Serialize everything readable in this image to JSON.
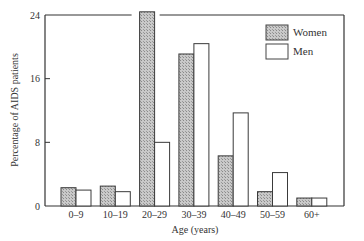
{
  "chart_data": {
    "type": "bar",
    "title": "",
    "xlabel": "Age (years)",
    "ylabel": "Percentage of AIDS patients",
    "ylim": [
      0,
      24
    ],
    "yticks": [
      0,
      8,
      16,
      24
    ],
    "grid": false,
    "legend_position": "upper right",
    "categories": [
      "0–9",
      "10–19",
      "20–29",
      "30–39",
      "40–49",
      "50–59",
      "60+"
    ],
    "series": [
      {
        "name": "Women",
        "pattern": "hatched-gray",
        "color": "#b8b8b8",
        "values": [
          2.3,
          2.5,
          24.4,
          19.1,
          6.3,
          1.8,
          1.0
        ]
      },
      {
        "name": "Men",
        "pattern": "white",
        "color": "#ffffff",
        "values": [
          2.0,
          1.8,
          8.0,
          20.4,
          11.7,
          4.2,
          1.0
        ]
      }
    ],
    "annotations": [
      "Women 20–29 bar breaks through top frame (exceeds 24)"
    ]
  },
  "legend": {
    "items": [
      {
        "label": "Women"
      },
      {
        "label": "Men"
      }
    ]
  },
  "axes": {
    "x_title": "Age (years)",
    "y_title": "Percentage of AIDS patients",
    "y_tick_labels": [
      "0",
      "8",
      "16",
      "24"
    ]
  }
}
